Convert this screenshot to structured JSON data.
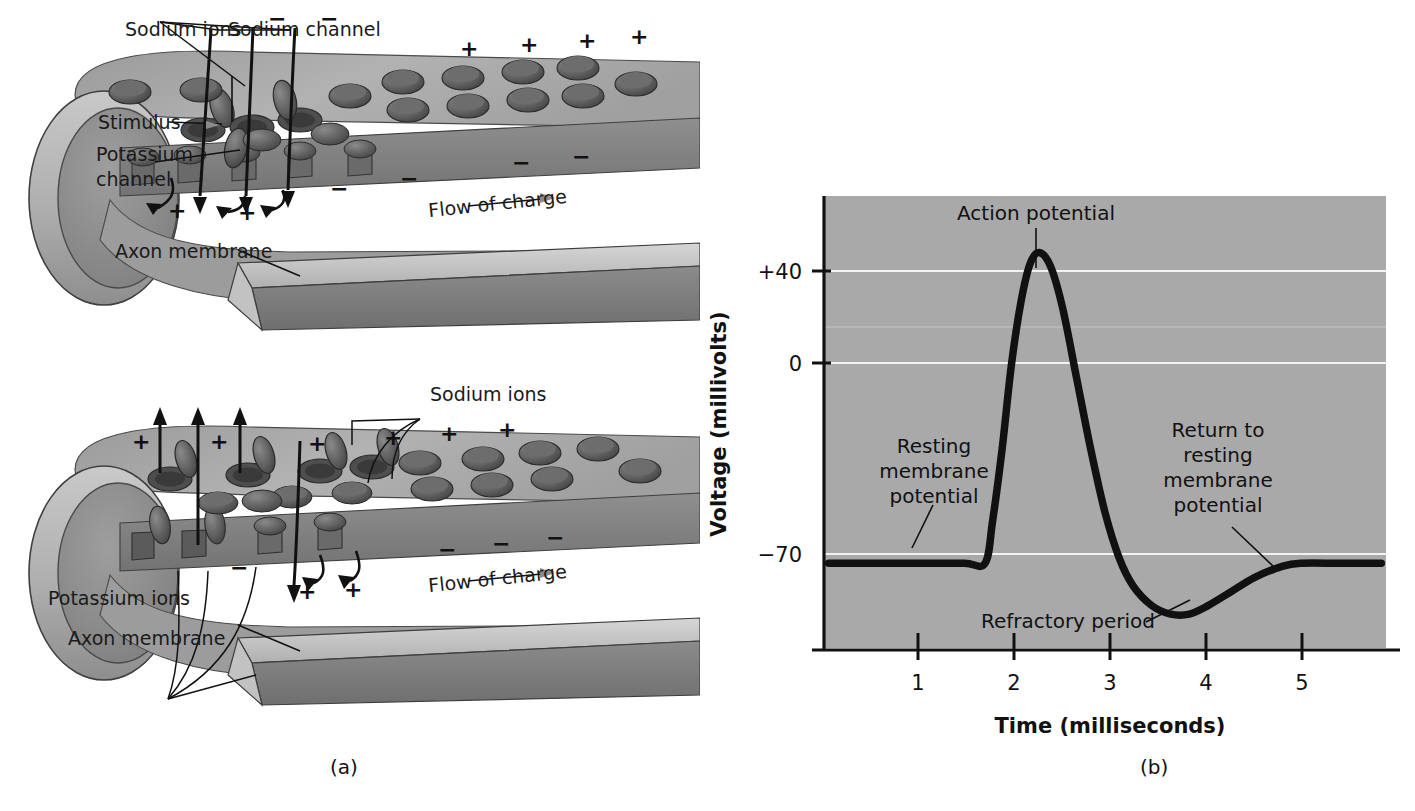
{
  "figure": {
    "panel_a_caption": "(a)",
    "panel_b_caption": "(b)"
  },
  "diagram_top": {
    "name": "depolarization-axon-diagram",
    "labels": {
      "sodium_ions": "Sodium ions",
      "sodium_channel": "Sodium channel",
      "stimulus": "Stimulus",
      "potassium_channel": "Potassium channel",
      "potassium_channel_line1": "Potassium",
      "potassium_channel_line2": "channel",
      "axon_membrane": "Axon membrane",
      "flow_of_charge": "Flow of charge"
    },
    "charges": {
      "outside_top": [
        "−",
        "−",
        "+",
        "+",
        "+",
        "+"
      ],
      "inside": [
        "+",
        "+",
        "−",
        "−",
        "−",
        "−"
      ]
    }
  },
  "diagram_bottom": {
    "name": "repolarization-axon-diagram",
    "labels": {
      "sodium_ions": "Sodium ions",
      "potassium_ions": "Potassium ions",
      "axon_membrane": "Axon membrane",
      "flow_of_charge": "Flow of charge"
    },
    "charges": {
      "outside_top": [
        "+",
        "+",
        "+",
        "+",
        "+",
        "+"
      ],
      "inside": [
        "−",
        "+",
        "+",
        "−",
        "−",
        "−"
      ]
    }
  },
  "chart_data": {
    "type": "line",
    "title": "",
    "xlabel": "Time (milliseconds)",
    "ylabel": "Voltage (millivolts)",
    "xlim": [
      0,
      6
    ],
    "ylim": [
      -100,
      60
    ],
    "xticks": [
      1,
      2,
      3,
      4,
      5
    ],
    "xtick_labels": [
      "1",
      "2",
      "3",
      "4",
      "5"
    ],
    "yticks": [
      40,
      0,
      -70
    ],
    "ytick_labels": [
      "+40",
      "0",
      "−70"
    ],
    "gridlines_y": [
      40,
      20,
      0,
      -70
    ],
    "grid": true,
    "legend": "none",
    "series": [
      {
        "name": "Membrane potential",
        "points": [
          [
            0.05,
            -70
          ],
          [
            0.5,
            -70
          ],
          [
            1.0,
            -70
          ],
          [
            1.5,
            -70
          ],
          [
            1.72,
            -70
          ],
          [
            1.8,
            -55
          ],
          [
            1.9,
            -30
          ],
          [
            2.0,
            0
          ],
          [
            2.1,
            22
          ],
          [
            2.2,
            36
          ],
          [
            2.3,
            40
          ],
          [
            2.42,
            35
          ],
          [
            2.55,
            20
          ],
          [
            2.7,
            -5
          ],
          [
            2.85,
            -30
          ],
          [
            3.0,
            -52
          ],
          [
            3.15,
            -68
          ],
          [
            3.3,
            -78
          ],
          [
            3.5,
            -85
          ],
          [
            3.7,
            -88
          ],
          [
            3.9,
            -88
          ],
          [
            4.1,
            -85
          ],
          [
            4.35,
            -80
          ],
          [
            4.6,
            -75
          ],
          [
            4.9,
            -71
          ],
          [
            5.1,
            -70
          ],
          [
            5.5,
            -70
          ],
          [
            5.95,
            -70
          ]
        ]
      }
    ],
    "annotations": [
      {
        "name": "action-potential",
        "text": "Action potential",
        "lines": [
          "Action potential"
        ],
        "point": [
          2.3,
          40
        ]
      },
      {
        "name": "resting-membrane-potential",
        "text": "Resting membrane potential",
        "lines": [
          "Resting",
          "membrane",
          "potential"
        ],
        "point": [
          1.35,
          -70
        ]
      },
      {
        "name": "return-to-resting-membrane-potential",
        "text": "Return to resting membrane potential",
        "lines": [
          "Return to",
          "resting",
          "membrane",
          "potential"
        ],
        "point": [
          4.72,
          -72
        ]
      },
      {
        "name": "refractory-period",
        "text": "Refractory period",
        "lines": [
          "Refractory period"
        ],
        "point": [
          3.85,
          -88
        ]
      }
    ]
  },
  "colors": {
    "plot_background": "#a9a9a9",
    "gridline": "#f2f2f2",
    "curve": "#111111",
    "axis": "#111111",
    "membrane_outer": "#b4b4b4",
    "membrane_inner": "#8d8d8d",
    "channel": "#5a5a5a"
  }
}
